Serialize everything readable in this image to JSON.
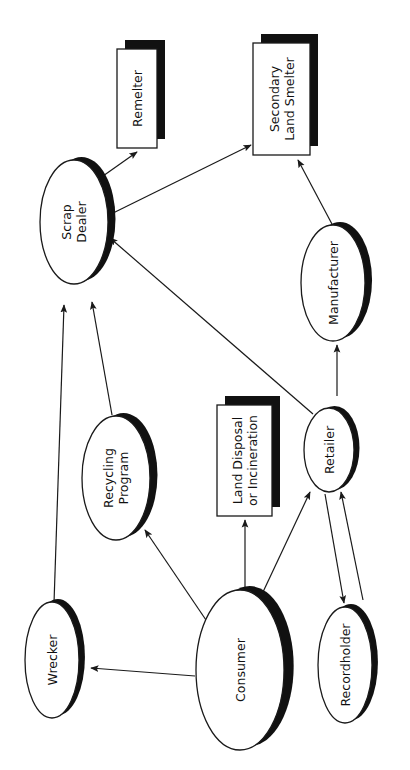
{
  "diagram": {
    "colors": {
      "line": "#1a1a1a",
      "shadow": "#111111",
      "fill": "#ffffff",
      "text": "#111111"
    },
    "nodes": [
      {
        "id": "remelter",
        "shape": "box",
        "lines": [
          "Remelter"
        ],
        "x": 117,
        "y": 49,
        "w": 40,
        "h": 99
      },
      {
        "id": "secondary-land-smelter",
        "shape": "box",
        "lines": [
          "Secondary",
          "Land Smelter"
        ],
        "x": 253,
        "y": 43,
        "w": 57,
        "h": 112
      },
      {
        "id": "scrap-dealer",
        "shape": "ellipse",
        "lines": [
          "Scrap",
          "Dealer"
        ],
        "cx": 74,
        "cy": 222,
        "rx": 34,
        "ry": 62
      },
      {
        "id": "manufacturer",
        "shape": "ellipse",
        "lines": [
          "Manufacturer"
        ],
        "cx": 333,
        "cy": 283,
        "rx": 32,
        "ry": 58
      },
      {
        "id": "recycling-program",
        "shape": "ellipse",
        "lines": [
          "Recycling",
          "Program"
        ],
        "cx": 116,
        "cy": 478,
        "rx": 34,
        "ry": 62
      },
      {
        "id": "land-disposal",
        "shape": "box",
        "lines": [
          "Land Disposal",
          "or Incineration"
        ],
        "x": 217,
        "y": 405,
        "w": 55,
        "h": 111
      },
      {
        "id": "retailer",
        "shape": "ellipse",
        "lines": [
          "Retailer"
        ],
        "cx": 329,
        "cy": 450,
        "rx": 25,
        "ry": 42
      },
      {
        "id": "wrecker",
        "shape": "ellipse",
        "lines": [
          "Wrecker"
        ],
        "cx": 52,
        "cy": 660,
        "rx": 27,
        "ry": 58
      },
      {
        "id": "consumer",
        "shape": "ellipse",
        "lines": [
          "Consumer"
        ],
        "cx": 240,
        "cy": 670,
        "rx": 44,
        "ry": 80
      },
      {
        "id": "recordholder",
        "shape": "ellipse",
        "lines": [
          "Recordholder"
        ],
        "cx": 345,
        "cy": 665,
        "rx": 27,
        "ry": 58
      }
    ],
    "edges": [
      {
        "from": "scrap-dealer",
        "to": "remelter",
        "x1": 86,
        "y1": 188,
        "x2": 137,
        "y2": 152
      },
      {
        "from": "scrap-dealer",
        "to": "secondary-land-smelter",
        "x1": 107,
        "y1": 216,
        "x2": 251,
        "y2": 145
      },
      {
        "from": "manufacturer",
        "to": "secondary-land-smelter",
        "x1": 333,
        "y1": 226,
        "x2": 298,
        "y2": 160
      },
      {
        "from": "retailer",
        "to": "scrap-dealer",
        "x1": 313,
        "y1": 414,
        "x2": 110,
        "y2": 238
      },
      {
        "from": "retailer",
        "to": "manufacturer",
        "x1": 337,
        "y1": 396,
        "x2": 337,
        "y2": 345
      },
      {
        "from": "wrecker",
        "to": "scrap-dealer",
        "x1": 54,
        "y1": 603,
        "x2": 64,
        "y2": 305
      },
      {
        "from": "recycling-program",
        "to": "scrap-dealer",
        "x1": 112,
        "y1": 415,
        "x2": 92,
        "y2": 302
      },
      {
        "from": "consumer",
        "to": "wrecker",
        "x1": 195,
        "y1": 676,
        "x2": 91,
        "y2": 668
      },
      {
        "from": "consumer",
        "to": "recycling-program",
        "x1": 206,
        "y1": 620,
        "x2": 145,
        "y2": 530
      },
      {
        "from": "consumer",
        "to": "land-disposal",
        "x1": 245,
        "y1": 594,
        "x2": 245,
        "y2": 520
      },
      {
        "from": "consumer",
        "to": "retailer",
        "x1": 263,
        "y1": 592,
        "x2": 310,
        "y2": 492
      },
      {
        "from": "retailer",
        "to": "recordholder",
        "x1": 325,
        "y1": 494,
        "x2": 344,
        "y2": 603
      },
      {
        "from": "recordholder",
        "to": "retailer",
        "x1": 363,
        "y1": 600,
        "x2": 341,
        "y2": 492
      }
    ]
  }
}
